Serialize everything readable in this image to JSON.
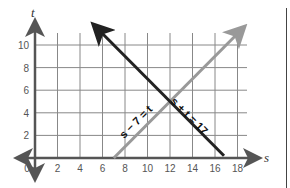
{
  "chart_data": {
    "type": "line",
    "title": "",
    "xlabel": "s",
    "ylabel": "t",
    "xlim": [
      0,
      18.5
    ],
    "ylim": [
      0,
      11
    ],
    "grid": true,
    "x_ticks": [
      "0",
      "2",
      "4",
      "6",
      "8",
      "10",
      "12",
      "14",
      "16",
      "18"
    ],
    "y_ticks": [
      "2",
      "4",
      "6",
      "8",
      "10"
    ],
    "series": [
      {
        "name": "s + t = 17",
        "label": "s + t = 17",
        "color": "#222222",
        "points": [
          [
            5.3,
            11.7
          ],
          [
            16.8,
            0.2
          ]
        ]
      },
      {
        "name": "s − 7 = t",
        "label": "s − 7 = t",
        "color": "#999999",
        "points": [
          [
            7,
            0
          ],
          [
            18.5,
            11.5
          ]
        ]
      }
    ],
    "intersection": [
      12,
      5
    ]
  },
  "colors": {
    "axis": "#555555",
    "grid": "#888888",
    "line_dark": "#222222",
    "line_light": "#999999"
  }
}
